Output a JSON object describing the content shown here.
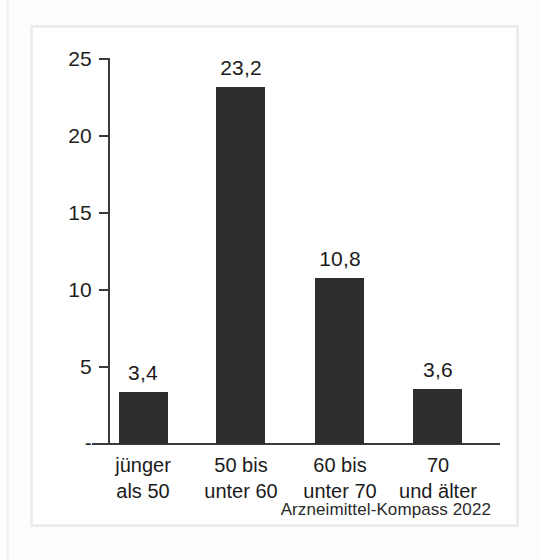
{
  "figure": {
    "background_color": "#fdfdfd",
    "frame_color": "#ededed",
    "axis_color": "#3a3a3a",
    "bar_color": "#2e2e2e",
    "text_color": "#1b1b1b",
    "source_note": "Arzneimittel-Kompass 2022"
  },
  "chart_data": {
    "type": "bar",
    "title": "",
    "subtitle": "",
    "xlabel": "",
    "ylabel": "",
    "categories": [
      "jünger als 50",
      "50 bis unter 60",
      "60 bis unter 70",
      "70 und älter"
    ],
    "category_lines": [
      [
        "jünger",
        "als 50"
      ],
      [
        "50 bis",
        "unter 60"
      ],
      [
        "60 bis",
        "unter 70"
      ],
      [
        "70",
        "und älter"
      ]
    ],
    "values": [
      3.4,
      23.2,
      10.8,
      3.6
    ],
    "value_labels": [
      "3,4",
      "23,2",
      "10,8",
      "3,6"
    ],
    "ylim": [
      0,
      25
    ],
    "yticks": [
      0,
      5,
      10,
      15,
      20,
      25
    ],
    "ytick_labels": [
      "-",
      "5",
      "10",
      "15",
      "20",
      "25"
    ],
    "grid": false,
    "legend": null,
    "annotations": [
      "Arzneimittel-Kompass 2022"
    ]
  }
}
